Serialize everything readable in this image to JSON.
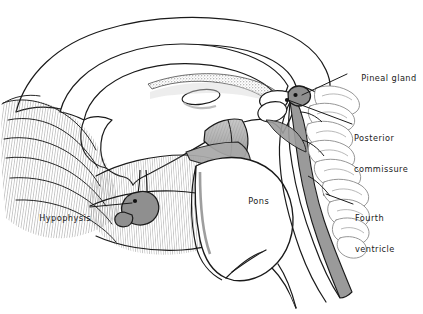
{
  "figure": {
    "background_color": "#ffffff",
    "ink_color": "#1a1a1a",
    "shade_gray": "#8f8f8f",
    "light_gray": "#d2d2d2",
    "hatch_gray": "#6f6f6f"
  },
  "labels": [
    {
      "id": "pineal-gland",
      "text": "Pineal gland",
      "x": 349,
      "y": 68,
      "align": "left",
      "leader": {
        "x1": 347,
        "y1": 75,
        "x2": 302,
        "y2": 96
      }
    },
    {
      "id": "posterior-commissure",
      "text": "Posterior\ncommissure",
      "line1": "Posterior",
      "line2": "commissure",
      "x": 354,
      "y": 118,
      "align": "left",
      "leader": {
        "x1": 352,
        "y1": 125,
        "x2": 288,
        "y2": 100
      }
    },
    {
      "id": "fourth-ventricle",
      "text": "Fourth\nventricle",
      "line1": "Fourth",
      "line2": "ventricle",
      "x": 355,
      "y": 198,
      "align": "left",
      "leader": {
        "x1": 353,
        "y1": 205,
        "x2": 325,
        "y2": 194
      }
    },
    {
      "id": "hypophysis",
      "text": "Hypophysis",
      "x": 27,
      "y": 204,
      "align": "left",
      "leader": {
        "x1": 91,
        "y1": 208,
        "x2": 136,
        "y2": 202
      }
    },
    {
      "id": "pons",
      "text": "Pons",
      "x": 236,
      "y": 190,
      "align": "left",
      "leader": null
    }
  ]
}
